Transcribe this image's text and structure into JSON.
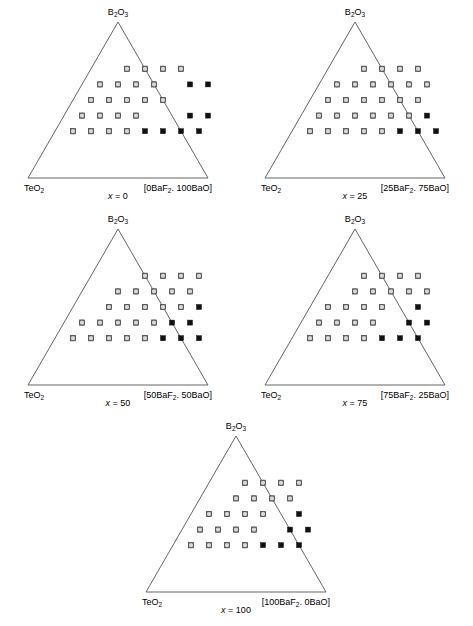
{
  "figure": {
    "panel_count": 5,
    "apex_label": "B2O3",
    "left_label": "TeO2",
    "colors": {
      "edge": "#555555",
      "grid": "#a5a5a5",
      "open_marker_fill": "#d8d8d8",
      "open_marker_stroke": "#4a4a4a",
      "filled_marker": "#111111",
      "background": "#ffffff"
    }
  },
  "chart_data": {
    "type": "scatter",
    "title": "",
    "subtitle": "",
    "xlabel": "",
    "ylabel": "",
    "grid": true,
    "legend_position": "none",
    "axis_system": "ternary",
    "grid_divisions": 10,
    "vertices": {
      "top": "B2O3",
      "left": "TeO2",
      "right": "[xBaF2. (100-x)BaO]"
    },
    "series_names": [
      "glass-forming (open circle)",
      "non-glass (filled square)"
    ],
    "panels": [
      {
        "id": "x0",
        "caption_var": "x",
        "caption_value": "0",
        "apex": "B2O3",
        "left_corner": "TeO2",
        "right_corner": "[0BaF2. 100BaO]",
        "right_corner_parts": {
          "pre": "[0BaF",
          "sub": "2",
          "post": ". 100BaO]"
        },
        "open_points": [
          [
            2,
            3
          ],
          [
            3,
            3
          ],
          [
            4,
            3
          ],
          [
            5,
            3
          ],
          [
            1,
            4
          ],
          [
            2,
            4
          ],
          [
            3,
            4
          ],
          [
            4,
            4
          ],
          [
            1,
            5
          ],
          [
            2,
            5
          ],
          [
            3,
            5
          ],
          [
            4,
            5
          ],
          [
            5,
            5
          ],
          [
            1,
            6
          ],
          [
            2,
            6
          ],
          [
            3,
            6
          ],
          [
            4,
            6
          ],
          [
            1,
            7
          ],
          [
            2,
            7
          ],
          [
            3,
            7
          ],
          [
            4,
            7
          ]
        ],
        "filled_points": [
          [
            6,
            4
          ],
          [
            7,
            4
          ],
          [
            7,
            6
          ],
          [
            8,
            6
          ],
          [
            5,
            7
          ],
          [
            6,
            7
          ],
          [
            7,
            7
          ],
          [
            8,
            7
          ]
        ]
      },
      {
        "id": "x25",
        "caption_var": "x",
        "caption_value": "25",
        "apex": "B2O3",
        "left_corner": "TeO2",
        "right_corner": "[25BaF2. 75BaO]",
        "right_corner_parts": {
          "pre": "[25BaF",
          "sub": "2",
          "post": ". 75BaO]"
        },
        "open_points": [
          [
            2,
            3
          ],
          [
            3,
            3
          ],
          [
            4,
            3
          ],
          [
            5,
            3
          ],
          [
            1,
            4
          ],
          [
            2,
            4
          ],
          [
            3,
            4
          ],
          [
            4,
            4
          ],
          [
            5,
            4
          ],
          [
            6,
            4
          ],
          [
            1,
            5
          ],
          [
            2,
            5
          ],
          [
            3,
            5
          ],
          [
            4,
            5
          ],
          [
            5,
            5
          ],
          [
            6,
            5
          ],
          [
            1,
            6
          ],
          [
            2,
            6
          ],
          [
            3,
            6
          ],
          [
            4,
            6
          ],
          [
            5,
            6
          ],
          [
            6,
            6
          ],
          [
            1,
            7
          ],
          [
            2,
            7
          ],
          [
            3,
            7
          ],
          [
            4,
            7
          ],
          [
            5,
            7
          ]
        ],
        "filled_points": [
          [
            7,
            6
          ],
          [
            6,
            7
          ],
          [
            7,
            7
          ],
          [
            8,
            7
          ]
        ]
      },
      {
        "id": "x50",
        "caption_var": "x",
        "caption_value": "50",
        "apex": "B2O3",
        "left_corner": "TeO2",
        "right_corner": "[50BaF2. 50BaO]",
        "right_corner_parts": {
          "pre": "[50BaF",
          "sub": "2",
          "post": ". 50BaO]"
        },
        "open_points": [
          [
            3,
            3
          ],
          [
            4,
            3
          ],
          [
            5,
            3
          ],
          [
            6,
            3
          ],
          [
            2,
            4
          ],
          [
            3,
            4
          ],
          [
            4,
            4
          ],
          [
            5,
            4
          ],
          [
            6,
            4
          ],
          [
            2,
            5
          ],
          [
            3,
            5
          ],
          [
            4,
            5
          ],
          [
            5,
            5
          ],
          [
            6,
            5
          ],
          [
            1,
            6
          ],
          [
            2,
            6
          ],
          [
            3,
            6
          ],
          [
            4,
            6
          ],
          [
            5,
            6
          ],
          [
            1,
            7
          ],
          [
            2,
            7
          ],
          [
            3,
            7
          ],
          [
            4,
            7
          ],
          [
            5,
            7
          ]
        ],
        "filled_points": [
          [
            7,
            5
          ],
          [
            6,
            6
          ],
          [
            7,
            6
          ],
          [
            6,
            7
          ],
          [
            7,
            7
          ],
          [
            8,
            7
          ]
        ]
      },
      {
        "id": "x75",
        "caption_var": "x",
        "caption_value": "75",
        "apex": "B2O3",
        "left_corner": "TeO2",
        "right_corner": "[75BaF2. 25BaO]",
        "right_corner_parts": {
          "pre": "[75BaF",
          "sub": "2",
          "post": ". 25BaO]"
        },
        "open_points": [
          [
            2,
            3
          ],
          [
            3,
            3
          ],
          [
            4,
            3
          ],
          [
            5,
            3
          ],
          [
            2,
            4
          ],
          [
            3,
            4
          ],
          [
            4,
            4
          ],
          [
            5,
            4
          ],
          [
            6,
            4
          ],
          [
            1,
            5
          ],
          [
            2,
            5
          ],
          [
            3,
            5
          ],
          [
            4,
            5
          ],
          [
            1,
            6
          ],
          [
            2,
            6
          ],
          [
            3,
            6
          ],
          [
            4,
            6
          ],
          [
            1,
            7
          ],
          [
            2,
            7
          ],
          [
            3,
            7
          ],
          [
            4,
            7
          ]
        ],
        "filled_points": [
          [
            6,
            5
          ],
          [
            6,
            6
          ],
          [
            7,
            6
          ],
          [
            5,
            7
          ],
          [
            6,
            7
          ],
          [
            7,
            7
          ]
        ]
      },
      {
        "id": "x100",
        "caption_var": "x",
        "caption_value": "100",
        "apex": "B2O3",
        "left_corner": "TeO2",
        "right_corner": "[100BaF2. 0BaO]",
        "right_corner_parts": {
          "pre": "[100BaF",
          "sub": "2",
          "post": ". 0BaO]"
        },
        "open_points": [
          [
            2,
            3
          ],
          [
            3,
            3
          ],
          [
            4,
            3
          ],
          [
            5,
            3
          ],
          [
            2,
            4
          ],
          [
            3,
            4
          ],
          [
            4,
            4
          ],
          [
            5,
            4
          ],
          [
            1,
            5
          ],
          [
            2,
            5
          ],
          [
            3,
            5
          ],
          [
            4,
            5
          ],
          [
            1,
            6
          ],
          [
            2,
            6
          ],
          [
            3,
            6
          ],
          [
            4,
            6
          ],
          [
            1,
            7
          ],
          [
            2,
            7
          ],
          [
            3,
            7
          ],
          [
            4,
            7
          ]
        ],
        "filled_points": [
          [
            6,
            5
          ],
          [
            6,
            6
          ],
          [
            7,
            6
          ],
          [
            5,
            7
          ],
          [
            6,
            7
          ],
          [
            7,
            7
          ]
        ]
      }
    ]
  }
}
